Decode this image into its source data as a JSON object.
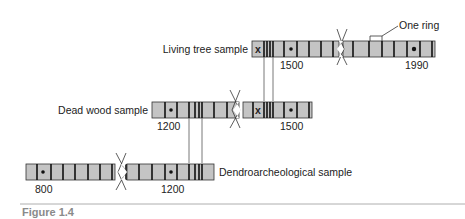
{
  "figure": {
    "caption": "Figure 1.4",
    "annotation": "One ring",
    "samples": [
      {
        "name": "Living tree sample",
        "years": [
          "1500",
          "1990"
        ]
      },
      {
        "name": "Dead wood sample",
        "years": [
          "1200",
          "1500"
        ]
      },
      {
        "name": "Dendroarcheological sample",
        "years": [
          "800",
          "1200"
        ]
      }
    ],
    "markers": {
      "dot": "ring-marker-dot",
      "cross": "x"
    },
    "colors": {
      "bar_fill": "#c4c4c4",
      "ring_line": "#111111",
      "connector": "#555555",
      "caption": "#8a8a8a",
      "rule": "#999999"
    }
  }
}
